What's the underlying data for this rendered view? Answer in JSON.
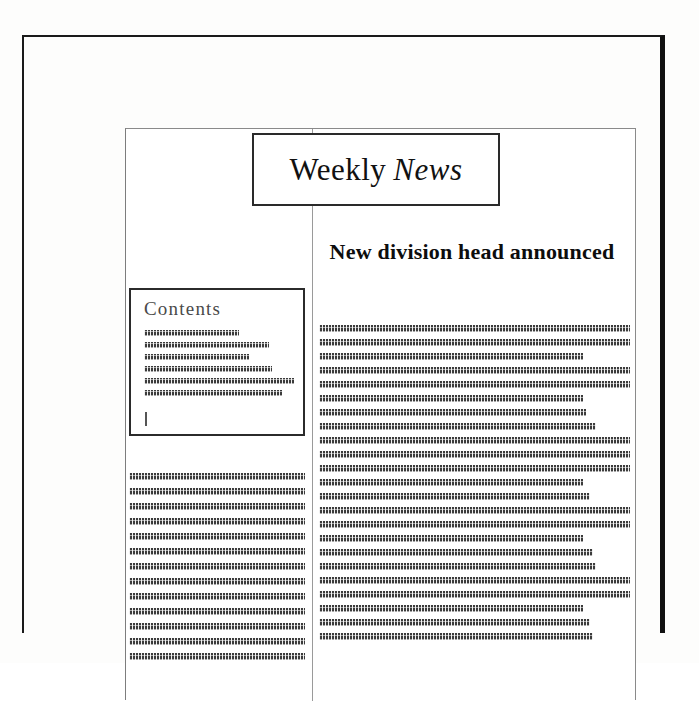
{
  "document": {
    "type": "newsletter-page-layout",
    "masthead": {
      "roman_word": "Weekly",
      "italic_word": "News"
    },
    "headline": "New division head announced",
    "contents_box": {
      "heading": "Contents",
      "entry_line_widths": [
        "63%",
        "83%",
        "70%",
        "85%",
        "100%",
        "92%"
      ],
      "caret": "text-cursor"
    },
    "left_column": {
      "line_widths": [
        "100%",
        "100%",
        "100%",
        "100%",
        "100%",
        "100%",
        "100%",
        "100%",
        "100%",
        "100%",
        "100%",
        "100%",
        "100%"
      ]
    },
    "right_column": {
      "line_widths": [
        "100%",
        "100%",
        "85%",
        "100%",
        "100%",
        "85%",
        "86%",
        "89%",
        "100%",
        "100%",
        "100%",
        "85%",
        "87%",
        "100%",
        "100%",
        "85%",
        "88%",
        "89%",
        "100%",
        "100%",
        "85%",
        "87%",
        "88%"
      ]
    }
  },
  "colors": {
    "frame": "#1a1a1a",
    "frame_shadow": "#111111",
    "page_border": "#8a8a8a",
    "column_rule": "#9a9a9a",
    "greek_text": "#3b3b3b",
    "heading_text": "#4a4a4a",
    "body_text": "#0d0d0d",
    "page_background": "#ffffff"
  }
}
